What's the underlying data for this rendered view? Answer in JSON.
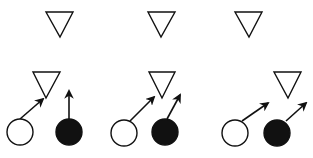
{
  "diagram": {
    "type": "vector-schematic",
    "background": "#ffffff",
    "stroke_color": "#111111",
    "fill_dark": "#111111",
    "fill_light": "#ffffff",
    "panels": [
      {
        "id": "panel-1",
        "top_triangle": {
          "points": "46,12 73,12 60,37"
        },
        "mid_triangle": {
          "points": "33,72 60,72 46,98"
        },
        "white_circle": {
          "cx": 20,
          "cy": 132,
          "r": 13
        },
        "black_circle": {
          "cx": 69,
          "cy": 132,
          "r": 13
        },
        "white_arrow": {
          "x1": 20,
          "y1": 119,
          "x2": 43,
          "y2": 99
        },
        "black_arrow": {
          "x1": 69,
          "y1": 119,
          "x2": 69,
          "y2": 91
        }
      },
      {
        "id": "panel-2",
        "top_triangle": {
          "points": "148,12 175,12 161,37"
        },
        "mid_triangle": {
          "points": "149,72 175,72 162,98"
        },
        "white_circle": {
          "cx": 124,
          "cy": 133,
          "r": 13
        },
        "black_circle": {
          "cx": 165,
          "cy": 132,
          "r": 13
        },
        "white_arrow": {
          "x1": 130,
          "y1": 121,
          "x2": 154,
          "y2": 97
        },
        "black_arrow": {
          "x1": 167,
          "y1": 119,
          "x2": 180,
          "y2": 95
        }
      },
      {
        "id": "panel-3",
        "top_triangle": {
          "points": "235,12 262,12 249,37"
        },
        "mid_triangle": {
          "points": "274,72 301,72 288,98"
        },
        "white_circle": {
          "cx": 235,
          "cy": 133,
          "r": 13
        },
        "black_circle": {
          "cx": 277,
          "cy": 133,
          "r": 13
        },
        "white_arrow": {
          "x1": 242,
          "y1": 121,
          "x2": 268,
          "y2": 103
        },
        "black_arrow": {
          "x1": 286,
          "y1": 121,
          "x2": 306,
          "y2": 103
        }
      }
    ]
  }
}
